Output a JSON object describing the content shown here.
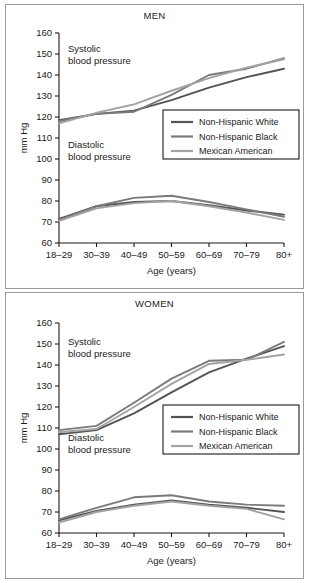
{
  "figure": {
    "panels": [
      {
        "id": "men",
        "title": "MEN",
        "annotation_systolic": [
          "Systolic",
          "blood pressure"
        ],
        "annotation_diastolic": [
          "Diastolic",
          "blood pressure"
        ]
      },
      {
        "id": "women",
        "title": "WOMEN",
        "annotation_systolic": [
          "Systolic",
          "blood pressure"
        ],
        "annotation_diastolic": [
          "Diastolic",
          "blood pressure"
        ]
      }
    ],
    "legend": {
      "items": [
        {
          "label": "Non-Hispanic White",
          "color": "#545454"
        },
        {
          "label": "Non-Hispanic Black",
          "color": "#7a7a7a"
        },
        {
          "label": "Mexican American",
          "color": "#a3a3a3"
        }
      ]
    }
  },
  "chart_data": [
    {
      "type": "line",
      "title": "MEN",
      "xlabel": "Age (years)",
      "ylabel": "mm Hg",
      "categories": [
        "18–29",
        "30–39",
        "40–49",
        "50–59",
        "60–69",
        "70–79",
        "80+"
      ],
      "ylim": [
        60,
        160
      ],
      "yticks": [
        60,
        70,
        80,
        90,
        100,
        110,
        120,
        130,
        140,
        150,
        160
      ],
      "grid": false,
      "legend_position": "center-right",
      "annotations": [
        "Systolic blood pressure",
        "Diastolic blood pressure"
      ],
      "series": [
        {
          "name": "Non-Hispanic White",
          "measure": "Systolic",
          "color": "#545454",
          "values": [
            118.5,
            121.5,
            123.0,
            128.0,
            134.0,
            139.0,
            143.0
          ]
        },
        {
          "name": "Non-Hispanic Black",
          "measure": "Systolic",
          "color": "#7a7a7a",
          "values": [
            118.0,
            121.5,
            122.5,
            130.5,
            140.0,
            143.0,
            148.0
          ]
        },
        {
          "name": "Mexican American",
          "measure": "Systolic",
          "color": "#a3a3a3",
          "values": [
            117.0,
            122.0,
            126.0,
            132.5,
            138.5,
            143.5,
            147.5
          ]
        },
        {
          "name": "Non-Hispanic White",
          "measure": "Diastolic",
          "color": "#545454",
          "values": [
            71.5,
            77.5,
            79.5,
            80.0,
            78.0,
            75.5,
            73.5
          ]
        },
        {
          "name": "Non-Hispanic Black",
          "measure": "Diastolic",
          "color": "#7a7a7a",
          "values": [
            71.0,
            77.5,
            81.5,
            82.5,
            79.5,
            76.0,
            72.5
          ]
        },
        {
          "name": "Mexican American",
          "measure": "Diastolic",
          "color": "#a3a3a3",
          "values": [
            70.5,
            76.5,
            79.0,
            80.0,
            77.5,
            74.5,
            71.0
          ]
        }
      ]
    },
    {
      "type": "line",
      "title": "WOMEN",
      "xlabel": "Age (years)",
      "ylabel": "mm Hg",
      "categories": [
        "18–29",
        "30–39",
        "40–49",
        "50–59",
        "60–69",
        "70–79",
        "80+"
      ],
      "ylim": [
        60,
        160
      ],
      "yticks": [
        60,
        70,
        80,
        90,
        100,
        110,
        120,
        130,
        140,
        150,
        160
      ],
      "grid": false,
      "legend_position": "center-right",
      "annotations": [
        "Systolic blood pressure",
        "Diastolic blood pressure"
      ],
      "series": [
        {
          "name": "Non-Hispanic White",
          "measure": "Systolic",
          "color": "#545454",
          "values": [
            107.0,
            109.0,
            117.0,
            127.0,
            136.5,
            143.0,
            149.0
          ]
        },
        {
          "name": "Non-Hispanic Black",
          "measure": "Systolic",
          "color": "#7a7a7a",
          "values": [
            109.0,
            111.0,
            122.0,
            133.5,
            142.0,
            142.5,
            151.0
          ]
        },
        {
          "name": "Mexican American",
          "measure": "Systolic",
          "color": "#a3a3a3",
          "values": [
            108.0,
            109.5,
            120.0,
            131.0,
            140.5,
            142.5,
            145.0
          ]
        },
        {
          "name": "Non-Hispanic White",
          "measure": "Diastolic",
          "color": "#545454",
          "values": [
            66.0,
            70.5,
            73.5,
            75.5,
            73.5,
            72.0,
            70.0
          ]
        },
        {
          "name": "Non-Hispanic Black",
          "measure": "Diastolic",
          "color": "#7a7a7a",
          "values": [
            66.5,
            72.0,
            77.0,
            78.0,
            75.0,
            73.5,
            73.0
          ]
        },
        {
          "name": "Mexican American",
          "measure": "Diastolic",
          "color": "#a3a3a3",
          "values": [
            65.0,
            70.0,
            73.0,
            75.0,
            73.0,
            71.5,
            66.5
          ]
        }
      ]
    }
  ]
}
